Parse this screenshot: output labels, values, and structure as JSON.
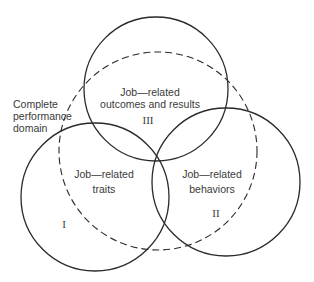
{
  "diagram": {
    "type": "venn",
    "circles": [
      {
        "id": "III",
        "cx": 156,
        "cy": 93,
        "r": 72,
        "style": "solid",
        "color": "#2a2a2a"
      },
      {
        "id": "I",
        "cx": 95,
        "cy": 196,
        "r": 74,
        "style": "solid",
        "color": "#2a2a2a"
      },
      {
        "id": "II",
        "cx": 226,
        "cy": 182,
        "r": 74,
        "style": "solid",
        "color": "#2a2a2a"
      },
      {
        "id": "domain",
        "cx": 158,
        "cy": 152,
        "r": 98,
        "style": "dashed",
        "color": "#2a2a2a"
      }
    ],
    "labels": {
      "domain": [
        "Complete",
        "performance",
        "domain"
      ],
      "outcomes": [
        "Job—related",
        "outcomes and results"
      ],
      "traits": [
        "Job—related",
        "traits"
      ],
      "behaviors": [
        "Job—related",
        "behaviors"
      ]
    },
    "roman": {
      "outcomes": "III",
      "traits": "I",
      "behaviors": "II"
    }
  }
}
